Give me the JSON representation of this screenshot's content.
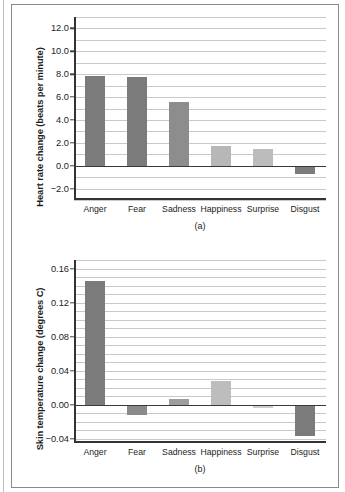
{
  "figure": {
    "panels": [
      "a",
      "b"
    ]
  },
  "chart_data": [
    {
      "type": "bar",
      "panel_label": "(a)",
      "title": "",
      "xlabel": "",
      "ylabel": "Heart rate change (beats per minute)",
      "categories": [
        "Anger",
        "Fear",
        "Sadness",
        "Happiness",
        "Surprise",
        "Disgust"
      ],
      "values": [
        7.8,
        7.75,
        5.55,
        1.75,
        1.5,
        -0.7
      ],
      "bar_colors": [
        "#7b7b7b",
        "#7b7b7b",
        "#8d8d8d",
        "#b7b7b7",
        "#bcbcbc",
        "#7b7b7b"
      ],
      "ylim": [
        -3.0,
        13.0
      ],
      "yticks": [
        -2.0,
        0.0,
        2.0,
        4.0,
        6.0,
        8.0,
        10.0,
        12.0
      ],
      "ytick_labels": [
        "−2.0",
        "0.0",
        "2.0",
        "4.0",
        "6.0",
        "8.0",
        "10.0",
        "12.0"
      ],
      "gridlines": [
        -3.0,
        -2.0,
        -1.0,
        1.0,
        2.0,
        3.0,
        4.0,
        5.0,
        6.0,
        7.0,
        8.0,
        9.0,
        10.0,
        11.0,
        12.0,
        13.0
      ],
      "grid": true,
      "legend": "none"
    },
    {
      "type": "bar",
      "panel_label": "(b)",
      "title": "",
      "xlabel": "",
      "ylabel": "Skin temperature change (degrees C)",
      "categories": [
        "Anger",
        "Fear",
        "Sadness",
        "Happiness",
        "Surprise",
        "Disgust"
      ],
      "values": [
        0.145,
        -0.012,
        0.007,
        0.028,
        -0.004,
        -0.037
      ],
      "bar_colors": [
        "#7b7b7b",
        "#8a8a8a",
        "#9d9d9d",
        "#bdbdbd",
        "#cfcfcf",
        "#7b7b7b"
      ],
      "ylim": [
        -0.045,
        0.17
      ],
      "yticks": [
        -0.04,
        0.0,
        0.04,
        0.08,
        0.12,
        0.16
      ],
      "ytick_labels": [
        "−0.04",
        "0.00",
        "0.04",
        "0.08",
        "0.12",
        "0.16"
      ],
      "gridlines": [
        -0.04,
        -0.03,
        -0.02,
        -0.01,
        0.01,
        0.02,
        0.03,
        0.04,
        0.05,
        0.06,
        0.07,
        0.08,
        0.09,
        0.1,
        0.11,
        0.12,
        0.13,
        0.14,
        0.15,
        0.16,
        0.17
      ],
      "grid": true,
      "legend": "none"
    }
  ]
}
